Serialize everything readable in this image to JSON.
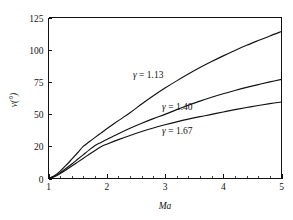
{
  "chart_data": {
    "type": "line",
    "title": "",
    "subtitle": "",
    "xlabel": "Ma",
    "ylabel": "v(°)",
    "xlim": [
      1,
      5
    ],
    "ylim": [
      0,
      125
    ],
    "grid": false,
    "legend_position": "inline-annotations",
    "x_ticks": [
      1,
      2,
      3,
      4,
      5
    ],
    "x_tick_labels": [
      "1",
      "2",
      "3",
      "4",
      "5"
    ],
    "x_minor_tick_step": 0.2,
    "y_ticks": [
      0,
      20,
      50,
      75,
      100,
      125
    ],
    "y_tick_labels": [
      "0",
      "20",
      "50",
      "75",
      "100",
      "125"
    ],
    "x": [
      1.0,
      1.1,
      1.2,
      1.3,
      1.4,
      1.5,
      1.6,
      1.7,
      1.8,
      1.9,
      2.0,
      2.2,
      2.4,
      2.6,
      2.8,
      3.0,
      3.2,
      3.4,
      3.6,
      3.8,
      4.0,
      4.2,
      4.4,
      4.6,
      4.8,
      5.0
    ],
    "series": [
      {
        "name": "γ = 1.13",
        "label": "γ = 1.13",
        "gamma": 1.13,
        "color": "#111111",
        "values": [
          0.0,
          1.7,
          4.6,
          8.1,
          12.0,
          16.0,
          20.1,
          24.2,
          28.3,
          32.3,
          36.3,
          43.9,
          51.1,
          57.8,
          64.2,
          70.2,
          75.8,
          81.1,
          86.1,
          90.8,
          95.2,
          99.4,
          103.4,
          107.1,
          110.7,
          114.1
        ],
        "label_x": 2.45,
        "label_y": 78.0
      },
      {
        "name": "γ = 1.40",
        "label": "γ = 1.40",
        "gamma": 1.4,
        "color": "#111111",
        "values": [
          0.0,
          1.34,
          3.56,
          6.17,
          8.99,
          11.91,
          14.86,
          17.81,
          20.73,
          23.59,
          26.38,
          31.73,
          36.75,
          41.41,
          45.75,
          49.76,
          53.47,
          56.91,
          60.09,
          63.04,
          65.78,
          68.33,
          70.71,
          72.92,
          75.0,
          76.92
        ],
        "label_x": 2.95,
        "label_y": 53.0
      },
      {
        "name": "γ = 1.67",
        "label": "γ = 1.67",
        "gamma": 1.67,
        "color": "#111111",
        "values": [
          0.0,
          1.18,
          3.1,
          5.33,
          7.72,
          10.17,
          12.62,
          15.04,
          17.42,
          19.73,
          21.97,
          26.21,
          30.13,
          33.72,
          37.01,
          40.02,
          42.77,
          45.29,
          47.6,
          49.72,
          51.67,
          53.47,
          55.13,
          56.67,
          58.1,
          59.43
        ],
        "label_x": 2.95,
        "label_y": 31.0
      }
    ]
  },
  "axes": {
    "y_title": "v(°)",
    "x_title": "Ma"
  },
  "annotations": [
    {
      "text": "γ = 1.13"
    },
    {
      "text": "γ = 1.40"
    },
    {
      "text": "γ = 1.67"
    }
  ]
}
